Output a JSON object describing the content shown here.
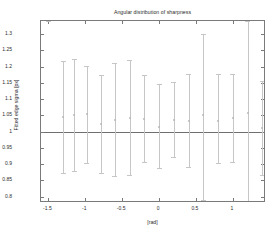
{
  "chart_data": {
    "type": "scatter",
    "title": "Angular distribution of sharpness",
    "xlabel": "[rad]",
    "ylabel": "Fitted edge sigma [px]",
    "xlim": [
      -1.6,
      1.45
    ],
    "ylim": [
      0.78,
      1.34
    ],
    "grid": false,
    "legend": null,
    "reference_line_y": 1,
    "xticks": [
      -1.5,
      -1,
      -0.5,
      0,
      0.5,
      1
    ],
    "xtick_labels": [
      "-1.5",
      "-1",
      "-0.5",
      "0",
      "0.5",
      "1"
    ],
    "yticks": [
      0.8,
      0.85,
      0.9,
      0.95,
      1,
      1.05,
      1.1,
      1.15,
      1.2,
      1.25,
      1.3
    ],
    "ytick_labels": [
      "0.8",
      "0.85",
      "0.9",
      "0.95",
      "1",
      "1.05",
      "1.1",
      "1.15",
      "1.2",
      "1.25",
      "1.3"
    ],
    "x": [
      -1.5,
      -1.3,
      -1.15,
      -0.98,
      -0.78,
      -0.6,
      -0.4,
      -0.2,
      0.0,
      0.2,
      0.4,
      0.6,
      0.8,
      1.0,
      1.2,
      1.4
    ],
    "values": [
      1.34,
      1.044,
      1.051,
      1.054,
      1.023,
      1.035,
      1.043,
      1.039,
      1.015,
      1.035,
      1.032,
      1.05,
      1.033,
      1.043,
      1.056,
      1.012
    ],
    "yerr_upper": [
      1.34,
      1.216,
      1.222,
      1.202,
      1.174,
      1.21,
      1.22,
      1.174,
      1.146,
      1.151,
      1.176,
      1.301,
      1.176,
      1.176,
      1.34,
      1.154
    ],
    "yerr_lower": [
      1.34,
      0.873,
      0.877,
      0.903,
      0.871,
      0.863,
      0.865,
      0.906,
      0.889,
      0.922,
      0.891,
      0.79,
      0.903,
      0.905,
      0.78,
      0.866
    ],
    "series_name": "Fitted edge sigma"
  }
}
